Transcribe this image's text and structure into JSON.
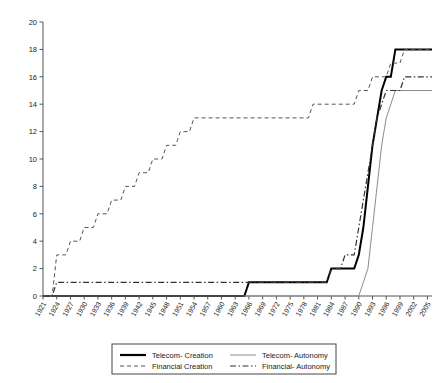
{
  "chart_data": {
    "type": "line",
    "title": "",
    "xlabel": "",
    "ylabel": "",
    "xlim": [
      1921,
      2006
    ],
    "ylim": [
      0,
      20
    ],
    "ytick_step": 2,
    "xtick_step": 3,
    "grid": false,
    "legend_position": "bottom",
    "yticks": [
      0,
      2,
      4,
      6,
      8,
      10,
      12,
      14,
      16,
      18,
      20
    ],
    "xticks": [
      1921,
      1924,
      1927,
      1930,
      1933,
      1936,
      1939,
      1942,
      1945,
      1948,
      1951,
      1954,
      1957,
      1960,
      1963,
      1966,
      1969,
      1972,
      1975,
      1978,
      1981,
      1984,
      1987,
      1990,
      1993,
      1996,
      1999,
      2002,
      2005
    ],
    "series": [
      {
        "name": "Telecom- Creation",
        "style": "solid",
        "color": "#000000",
        "width": 2.0,
        "points": [
          [
            1921,
            0
          ],
          [
            1965,
            0
          ],
          [
            1966,
            1
          ],
          [
            1983,
            1
          ],
          [
            1984,
            2
          ],
          [
            1989,
            2
          ],
          [
            1990,
            3
          ],
          [
            1991,
            5
          ],
          [
            1992,
            8
          ],
          [
            1993,
            11
          ],
          [
            1994,
            13
          ],
          [
            1995,
            15
          ],
          [
            1996,
            16
          ],
          [
            1997,
            16
          ],
          [
            1998,
            18
          ],
          [
            2006,
            18
          ]
        ]
      },
      {
        "name": "Financial Creation",
        "style": "dashed",
        "color": "#555555",
        "width": 1.0,
        "points": [
          [
            1921,
            0
          ],
          [
            1923,
            0
          ],
          [
            1924,
            3
          ],
          [
            1926,
            3
          ],
          [
            1927,
            4
          ],
          [
            1929,
            4
          ],
          [
            1930,
            5
          ],
          [
            1932,
            5
          ],
          [
            1933,
            6
          ],
          [
            1935,
            6
          ],
          [
            1936,
            7
          ],
          [
            1938,
            7
          ],
          [
            1939,
            8
          ],
          [
            1941,
            8
          ],
          [
            1942,
            9
          ],
          [
            1944,
            9
          ],
          [
            1945,
            10
          ],
          [
            1947,
            10
          ],
          [
            1948,
            11
          ],
          [
            1950,
            11
          ],
          [
            1951,
            12
          ],
          [
            1953,
            12
          ],
          [
            1954,
            13
          ],
          [
            1979,
            13
          ],
          [
            1980,
            14
          ],
          [
            1989,
            14
          ],
          [
            1990,
            15
          ],
          [
            1992,
            15
          ],
          [
            1993,
            16
          ],
          [
            1996,
            16
          ],
          [
            1997,
            17
          ],
          [
            1999,
            17
          ],
          [
            2000,
            18
          ],
          [
            2006,
            18
          ]
        ]
      },
      {
        "name": "Telecom- Autonomy",
        "style": "solid",
        "color": "#8c8c8c",
        "width": 1.0,
        "points": [
          [
            1921,
            0
          ],
          [
            1990,
            0
          ],
          [
            1991,
            1
          ],
          [
            1992,
            2
          ],
          [
            1993,
            5
          ],
          [
            1994,
            8
          ],
          [
            1995,
            11
          ],
          [
            1996,
            13
          ],
          [
            1997,
            14
          ],
          [
            1998,
            15
          ],
          [
            2006,
            15
          ]
        ]
      },
      {
        "name": "Financial- Autonomy",
        "style": "dashdot",
        "color": "#333333",
        "width": 1.2,
        "points": [
          [
            1921,
            0
          ],
          [
            1923,
            0
          ],
          [
            1924,
            1
          ],
          [
            1983,
            1
          ],
          [
            1984,
            2
          ],
          [
            1986,
            2
          ],
          [
            1987,
            3
          ],
          [
            1989,
            3
          ],
          [
            1990,
            5
          ],
          [
            1991,
            7
          ],
          [
            1992,
            9
          ],
          [
            1993,
            11
          ],
          [
            1994,
            13
          ],
          [
            1995,
            14
          ],
          [
            1996,
            15
          ],
          [
            1999,
            15
          ],
          [
            2000,
            16
          ],
          [
            2006,
            16
          ]
        ]
      }
    ]
  },
  "legend": {
    "entries": [
      {
        "label": "Telecom- Creation",
        "style": "solid",
        "color": "#000000",
        "width": 2.2
      },
      {
        "label": "Telecom- Autonomy",
        "style": "solid",
        "color": "#8c8c8c",
        "width": 1.0
      },
      {
        "label": "Financial Creation",
        "style": "dashed",
        "color": "#555555",
        "width": 1.0
      },
      {
        "label": "Financial- Autonomy",
        "style": "dashdot",
        "color": "#333333",
        "width": 1.2
      }
    ]
  }
}
